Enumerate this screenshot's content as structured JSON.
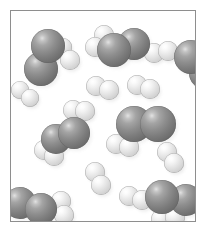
{
  "figure": {
    "kind": "space-filling-molecular-model",
    "caption": "",
    "background_color": "#ffffff",
    "frame_color": "#8e8e8e",
    "frame": {
      "x": 10,
      "y": 10,
      "width": 186,
      "height": 212
    }
  },
  "legend": {
    "atom_types": [
      {
        "name": "heavy-atom",
        "symbol": "N",
        "color": "#7c7c7c",
        "radius_px": 15,
        "description": "large dark gray sphere"
      },
      {
        "name": "light-atom",
        "symbol": "H",
        "color": "#e4e4e4",
        "radius_px": 8,
        "description": "small light gray sphere"
      }
    ]
  },
  "molecules": [
    {
      "id": "nitrogen-top-left",
      "species": "N2H2-cluster",
      "label": "ammonia-like molecule",
      "atoms": [
        {
          "type": "dark",
          "cx": 37,
          "cy": 35,
          "r": 17,
          "z": 3
        },
        {
          "type": "dark",
          "cx": 30,
          "cy": 58,
          "r": 17,
          "z": 2
        },
        {
          "type": "light",
          "cx": 59,
          "cy": 49,
          "r": 10,
          "z": 1
        },
        {
          "type": "light",
          "cx": 52,
          "cy": 36,
          "r": 9,
          "z": 0
        }
      ]
    },
    {
      "id": "ammonia-top-center",
      "species": "NH3-like",
      "label": "ammonia molecule",
      "atoms": [
        {
          "type": "light",
          "cx": 93,
          "cy": 24,
          "r": 10,
          "z": 1
        },
        {
          "type": "light",
          "cx": 84,
          "cy": 36,
          "r": 10,
          "z": 1
        },
        {
          "type": "dark",
          "cx": 103,
          "cy": 39,
          "r": 17,
          "z": 3
        },
        {
          "type": "dark",
          "cx": 123,
          "cy": 33,
          "r": 16,
          "z": 2
        }
      ]
    },
    {
      "id": "hydrogen-top-right",
      "species": "H2",
      "label": "hydrogen molecule",
      "atoms": [
        {
          "type": "light",
          "cx": 143,
          "cy": 42,
          "r": 10,
          "z": 1
        },
        {
          "type": "light",
          "cx": 157,
          "cy": 40,
          "r": 10,
          "z": 1
        }
      ]
    },
    {
      "id": "nitrogen-right-edge",
      "species": "N2",
      "label": "nitrogen molecule at right edge",
      "atoms": [
        {
          "type": "dark",
          "cx": 180,
          "cy": 46,
          "r": 17,
          "z": 2
        },
        {
          "type": "dark",
          "cx": 194,
          "cy": 62,
          "r": 16,
          "z": 1
        }
      ]
    },
    {
      "id": "hydrogen-left-edge",
      "species": "H2",
      "label": "hydrogen molecule at left edge",
      "atoms": [
        {
          "type": "light",
          "cx": 9,
          "cy": 79,
          "r": 9,
          "z": 1
        },
        {
          "type": "light",
          "cx": 19,
          "cy": 87,
          "r": 9,
          "z": 1
        }
      ]
    },
    {
      "id": "hydrogen-center-upper",
      "species": "H2",
      "label": "hydrogen molecule",
      "atoms": [
        {
          "type": "light",
          "cx": 85,
          "cy": 75,
          "r": 10,
          "z": 1
        },
        {
          "type": "light",
          "cx": 98,
          "cy": 79,
          "r": 10,
          "z": 1
        }
      ]
    },
    {
      "id": "hydrogen-center-upper-right",
      "species": "H2",
      "label": "hydrogen molecule",
      "atoms": [
        {
          "type": "light",
          "cx": 126,
          "cy": 74,
          "r": 10,
          "z": 1
        },
        {
          "type": "light",
          "cx": 139,
          "cy": 78,
          "r": 10,
          "z": 1
        }
      ]
    },
    {
      "id": "ammonia-middle-left",
      "species": "N2H4-like",
      "label": "hydrazine-like molecule",
      "atoms": [
        {
          "type": "light",
          "cx": 62,
          "cy": 99,
          "r": 10,
          "z": 1
        },
        {
          "type": "light",
          "cx": 74,
          "cy": 100,
          "r": 10,
          "z": 1
        },
        {
          "type": "dark",
          "cx": 63,
          "cy": 122,
          "r": 16,
          "z": 3
        },
        {
          "type": "dark",
          "cx": 45,
          "cy": 128,
          "r": 15,
          "z": 2
        },
        {
          "type": "light",
          "cx": 33,
          "cy": 139,
          "r": 10,
          "z": 1
        },
        {
          "type": "light",
          "cx": 43,
          "cy": 145,
          "r": 10,
          "z": 1
        }
      ]
    },
    {
      "id": "nitrogen-center-right",
      "species": "N2",
      "label": "nitrogen molecule",
      "atoms": [
        {
          "type": "dark",
          "cx": 123,
          "cy": 113,
          "r": 18,
          "z": 2
        },
        {
          "type": "dark",
          "cx": 147,
          "cy": 113,
          "r": 18,
          "z": 2
        }
      ]
    },
    {
      "id": "hydrogen-center",
      "species": "H2",
      "label": "hydrogen molecule",
      "atoms": [
        {
          "type": "light",
          "cx": 105,
          "cy": 133,
          "r": 10,
          "z": 1
        },
        {
          "type": "light",
          "cx": 118,
          "cy": 136,
          "r": 10,
          "z": 1
        }
      ]
    },
    {
      "id": "hydrogen-right-middle",
      "species": "H2",
      "label": "hydrogen molecule",
      "atoms": [
        {
          "type": "light",
          "cx": 156,
          "cy": 141,
          "r": 10,
          "z": 1
        },
        {
          "type": "light",
          "cx": 163,
          "cy": 152,
          "r": 10,
          "z": 1
        }
      ]
    },
    {
      "id": "hydrogen-center-lower",
      "species": "H2",
      "label": "hydrogen molecule",
      "atoms": [
        {
          "type": "light",
          "cx": 84,
          "cy": 161,
          "r": 10,
          "z": 1
        },
        {
          "type": "light",
          "cx": 90,
          "cy": 174,
          "r": 10,
          "z": 1
        }
      ]
    },
    {
      "id": "ammonia-bottom-left",
      "species": "N2H2-cluster",
      "label": "ammonia-like molecule at bottom left",
      "atoms": [
        {
          "type": "dark",
          "cx": 9,
          "cy": 192,
          "r": 16,
          "z": 2
        },
        {
          "type": "dark",
          "cx": 30,
          "cy": 198,
          "r": 16,
          "z": 3
        },
        {
          "type": "light",
          "cx": 50,
          "cy": 190,
          "r": 10,
          "z": 1
        },
        {
          "type": "light",
          "cx": 53,
          "cy": 204,
          "r": 10,
          "z": 1
        }
      ]
    },
    {
      "id": "hydrogen-bottom-center",
      "species": "H2",
      "label": "hydrogen molecule",
      "atoms": [
        {
          "type": "light",
          "cx": 118,
          "cy": 185,
          "r": 10,
          "z": 1
        },
        {
          "type": "light",
          "cx": 131,
          "cy": 189,
          "r": 10,
          "z": 1
        }
      ]
    },
    {
      "id": "ammonia-bottom-right",
      "species": "NH3-like",
      "label": "ammonia molecule at bottom right",
      "atoms": [
        {
          "type": "dark",
          "cx": 151,
          "cy": 186,
          "r": 17,
          "z": 3
        },
        {
          "type": "dark",
          "cx": 175,
          "cy": 189,
          "r": 16,
          "z": 2
        },
        {
          "type": "light",
          "cx": 150,
          "cy": 208,
          "r": 10,
          "z": 1
        },
        {
          "type": "light",
          "cx": 164,
          "cy": 206,
          "r": 10,
          "z": 1
        }
      ]
    }
  ]
}
